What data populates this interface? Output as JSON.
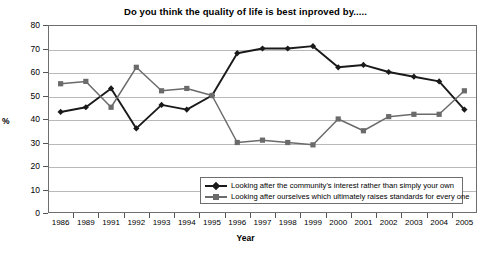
{
  "chart_data": {
    "type": "line",
    "title": "Do you think the quality of life is best inproved by.....",
    "xlabel": "Year",
    "ylabel": "%",
    "ylim": [
      0,
      80
    ],
    "ytick_step": 10,
    "yticks": [
      "80",
      "70",
      "60",
      "50",
      "40",
      "30",
      "20",
      "10",
      "0"
    ],
    "grid": true,
    "legend_position": "inside-bottom-right",
    "categories": [
      "1986",
      "1989",
      "1991",
      "1992",
      "1993",
      "1994",
      "1995",
      "1996",
      "1997",
      "1998",
      "1999",
      "2000",
      "2001",
      "2002",
      "2003",
      "2004",
      "2005"
    ],
    "series": [
      {
        "name": "Looking after the community's interest rather than simply your own",
        "color": "#1a1a1a",
        "marker": "diamond",
        "values": [
          43,
          45,
          53,
          36,
          46,
          44,
          50,
          68,
          70,
          70,
          71,
          62,
          63,
          60,
          58,
          56,
          44
        ]
      },
      {
        "name": "Looking after ourselves which ultimately raises standards for every one",
        "color": "#6b6b6b",
        "marker": "square",
        "values": [
          55,
          56,
          45,
          62,
          52,
          53,
          50,
          30,
          31,
          30,
          29,
          40,
          35,
          41,
          42,
          42,
          52
        ]
      }
    ]
  },
  "legend": {
    "items": [
      {
        "label": "Looking after the community's interest rather than simply your own"
      },
      {
        "label": "Looking after ourselves which ultimately raises standards for every one"
      }
    ]
  }
}
